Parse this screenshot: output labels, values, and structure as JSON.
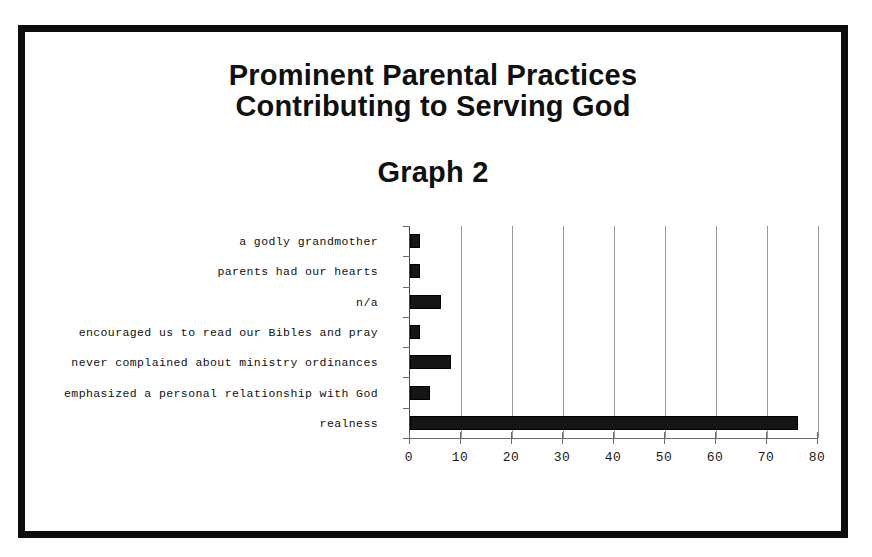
{
  "slide": {
    "title_line_1": "Prominent Parental Practices",
    "title_line_2": "Contributing to Serving God",
    "subtitle": "Graph 2",
    "frame_color": "#0d0d0d",
    "background_color": "#ffffff"
  },
  "chart_data": {
    "type": "bar",
    "orientation": "horizontal",
    "title": "Prominent Parental Practices Contributing to Serving God",
    "subtitle": "Graph 2",
    "xlabel": "",
    "ylabel": "",
    "xlim": [
      0,
      80
    ],
    "xticks": [
      0,
      10,
      20,
      30,
      40,
      50,
      60,
      70,
      80
    ],
    "xtick_labels": [
      "0",
      "10",
      "20",
      "30",
      "40",
      "50",
      "60",
      "70",
      "80"
    ],
    "grid": true,
    "grid_axis": "x",
    "legend": false,
    "bar_color": "#151515",
    "categories": [
      "a godly grandmother",
      "parents had our hearts",
      "n/a",
      "encouraged us to read our Bibles and pray",
      "never complained about ministry ordinances",
      "emphasized a personal relationship with God",
      "realness"
    ],
    "values": [
      2,
      2,
      6,
      2,
      8,
      4,
      76
    ]
  }
}
